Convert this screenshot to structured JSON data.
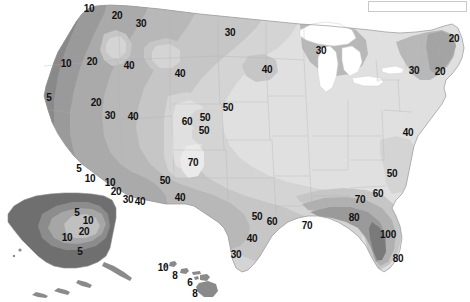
{
  "figure": {
    "type": "contour-map",
    "region": "United States (with Alaska and Hawaii insets)",
    "background_color": "#ffffff",
    "label_color": "#111111"
  },
  "legend_box": {
    "name": "legend-box",
    "x": 368,
    "y": 1,
    "width": 99,
    "height": 11,
    "border_color": "#c9c9c9",
    "fill_color": "#ffffff",
    "text": ""
  },
  "chart_data": {
    "type": "contour",
    "title": "",
    "xlabel": "",
    "ylabel": "",
    "units": "",
    "contour_levels": [
      5,
      6,
      8,
      10,
      20,
      30,
      40,
      50,
      60,
      70,
      80,
      100
    ],
    "grayscale_bands": [
      {
        "level": "<=5",
        "color": "#6f6f6f"
      },
      {
        "level": "5-10",
        "color": "#8c8c8c"
      },
      {
        "level": "10-20",
        "color": "#9d9d9d"
      },
      {
        "level": "20-30",
        "color": "#ababab"
      },
      {
        "level": "30-40",
        "color": "#b9b9b9"
      },
      {
        "level": "40-50",
        "color": "#c7c7c7"
      },
      {
        "level": "50-60",
        "color": "#d6d6d6"
      },
      {
        "level": "60-70",
        "color": "#e4e4e4"
      },
      {
        "level": "70-80",
        "color": "#efefef"
      },
      {
        "level": ">80",
        "color": "#f7f7f7"
      },
      {
        "level": "water",
        "color": "#ffffff"
      }
    ],
    "labels": [
      {
        "text": "10",
        "x": 89,
        "y": 9,
        "region": "pacific-northwest"
      },
      {
        "text": "20",
        "x": 117,
        "y": 16,
        "region": "pacific-northwest"
      },
      {
        "text": "30",
        "x": 141,
        "y": 24,
        "region": "northern-rockies"
      },
      {
        "text": "30",
        "x": 230,
        "y": 33,
        "region": "northern-plains"
      },
      {
        "text": "10",
        "x": 66,
        "y": 64,
        "region": "oregon"
      },
      {
        "text": "20",
        "x": 92,
        "y": 62,
        "region": "idaho"
      },
      {
        "text": "40",
        "x": 129,
        "y": 66,
        "region": "montana"
      },
      {
        "text": "40",
        "x": 180,
        "y": 74,
        "region": "wyoming-north"
      },
      {
        "text": "40",
        "x": 267,
        "y": 70,
        "region": "north-dakota"
      },
      {
        "text": "30",
        "x": 321,
        "y": 51,
        "region": "great-lakes-north"
      },
      {
        "text": "30",
        "x": 414,
        "y": 71,
        "region": "new-york"
      },
      {
        "text": "20",
        "x": 454,
        "y": 39,
        "region": "maine"
      },
      {
        "text": "20",
        "x": 440,
        "y": 72,
        "region": "southern-new-england"
      },
      {
        "text": "5",
        "x": 49,
        "y": 98,
        "region": "northern-california"
      },
      {
        "text": "20",
        "x": 96,
        "y": 103,
        "region": "nevada-north"
      },
      {
        "text": "30",
        "x": 110,
        "y": 116,
        "region": "nevada"
      },
      {
        "text": "40",
        "x": 133,
        "y": 117,
        "region": "utah"
      },
      {
        "text": "50",
        "x": 228,
        "y": 108,
        "region": "nebraska"
      },
      {
        "text": "60",
        "x": 187,
        "y": 122,
        "region": "colorado-west"
      },
      {
        "text": "50",
        "x": 205,
        "y": 118,
        "region": "colorado"
      },
      {
        "text": "50",
        "x": 204,
        "y": 131,
        "region": "colorado-south"
      },
      {
        "text": "70",
        "x": 193,
        "y": 163,
        "region": "colorado-mountains"
      },
      {
        "text": "50",
        "x": 165,
        "y": 181,
        "region": "new-mexico-west"
      },
      {
        "text": "40",
        "x": 180,
        "y": 198,
        "region": "new-mexico"
      },
      {
        "text": "5",
        "x": 79,
        "y": 169,
        "region": "southern-california"
      },
      {
        "text": "10",
        "x": 90,
        "y": 179,
        "region": "southern-california-inland"
      },
      {
        "text": "10",
        "x": 110,
        "y": 183,
        "region": "arizona-west"
      },
      {
        "text": "20",
        "x": 116,
        "y": 192,
        "region": "arizona"
      },
      {
        "text": "30",
        "x": 128,
        "y": 200,
        "region": "arizona-south"
      },
      {
        "text": "40",
        "x": 140,
        "y": 202,
        "region": "new-mexico-southwest"
      },
      {
        "text": "50",
        "x": 257,
        "y": 217,
        "region": "texas-central"
      },
      {
        "text": "60",
        "x": 272,
        "y": 222,
        "region": "texas-east"
      },
      {
        "text": "70",
        "x": 307,
        "y": 226,
        "region": "louisiana-west"
      },
      {
        "text": "40",
        "x": 252,
        "y": 239,
        "region": "texas-south"
      },
      {
        "text": "30",
        "x": 236,
        "y": 255,
        "region": "texas-rio-grande"
      },
      {
        "text": "40",
        "x": 408,
        "y": 133,
        "region": "mid-atlantic"
      },
      {
        "text": "50",
        "x": 392,
        "y": 174,
        "region": "south-carolina"
      },
      {
        "text": "60",
        "x": 378,
        "y": 194,
        "region": "georgia"
      },
      {
        "text": "70",
        "x": 360,
        "y": 200,
        "region": "alabama"
      },
      {
        "text": "80",
        "x": 354,
        "y": 218,
        "region": "gulf-coast"
      },
      {
        "text": "100",
        "x": 388,
        "y": 235,
        "region": "south-florida"
      },
      {
        "text": "80",
        "x": 398,
        "y": 259,
        "region": "florida-peninsula"
      },
      {
        "text": "5",
        "x": 77,
        "y": 213,
        "region": "alaska-north"
      },
      {
        "text": "10",
        "x": 88,
        "y": 221,
        "region": "alaska-interior"
      },
      {
        "text": "20",
        "x": 84,
        "y": 232,
        "region": "alaska-southcentral"
      },
      {
        "text": "10",
        "x": 67,
        "y": 238,
        "region": "alaska-southwest"
      },
      {
        "text": "5",
        "x": 80,
        "y": 252,
        "region": "alaska-south"
      },
      {
        "text": "10",
        "x": 163,
        "y": 268,
        "region": "hawaii-kauai"
      },
      {
        "text": "8",
        "x": 175,
        "y": 276,
        "region": "hawaii-oahu"
      },
      {
        "text": "6",
        "x": 190,
        "y": 283,
        "region": "hawaii-maui"
      },
      {
        "text": "8",
        "x": 195,
        "y": 294,
        "region": "hawaii-big-island"
      }
    ]
  }
}
